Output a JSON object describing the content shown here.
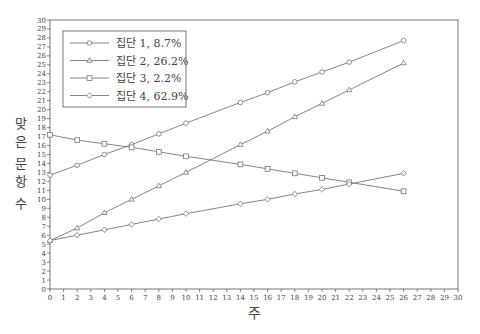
{
  "chart_data": {
    "type": "line",
    "title": "",
    "xlabel": "주",
    "ylabel": "맞은 문항 수",
    "xlim": [
      0,
      30
    ],
    "ylim": [
      0,
      30
    ],
    "x_ticks": [
      0,
      1,
      2,
      3,
      4,
      5,
      6,
      7,
      8,
      9,
      10,
      11,
      12,
      13,
      14,
      15,
      16,
      17,
      18,
      19,
      20,
      21,
      22,
      23,
      24,
      25,
      26,
      27,
      28,
      29,
      30
    ],
    "y_ticks": [
      0,
      1,
      2,
      3,
      4,
      5,
      6,
      7,
      8,
      9,
      10,
      11,
      12,
      13,
      14,
      15,
      16,
      17,
      18,
      19,
      20,
      21,
      22,
      23,
      24,
      25,
      26,
      27,
      28,
      29,
      30
    ],
    "grid": false,
    "legend_position": "upper-left",
    "x": [
      0,
      2,
      4,
      6,
      8,
      10,
      14,
      16,
      18,
      20,
      22,
      26
    ],
    "series": [
      {
        "name": "집단 1, 8.7%",
        "marker": "circle",
        "values": [
          12.7,
          13.8,
          15.0,
          16.1,
          17.3,
          18.5,
          20.8,
          21.9,
          23.1,
          24.2,
          25.3,
          27.7
        ]
      },
      {
        "name": "집단 2, 26.2%",
        "marker": "triangle",
        "values": [
          5.4,
          6.8,
          8.5,
          10.0,
          11.5,
          13.0,
          16.1,
          17.6,
          19.2,
          20.7,
          22.2,
          25.2
        ]
      },
      {
        "name": "집단 3, 2.2%",
        "marker": "square",
        "values": [
          17.2,
          16.6,
          16.2,
          15.8,
          15.3,
          14.8,
          13.9,
          13.4,
          12.9,
          12.4,
          11.9,
          10.9
        ]
      },
      {
        "name": "집단 4, 62.9%",
        "marker": "diamond",
        "values": [
          5.4,
          6.0,
          6.6,
          7.2,
          7.8,
          8.4,
          9.5,
          10.0,
          10.6,
          11.1,
          11.7,
          12.9
        ]
      }
    ]
  },
  "colors": {
    "line": "#777777",
    "axis": "#555555",
    "text": "#444444",
    "background": "#ffffff"
  }
}
